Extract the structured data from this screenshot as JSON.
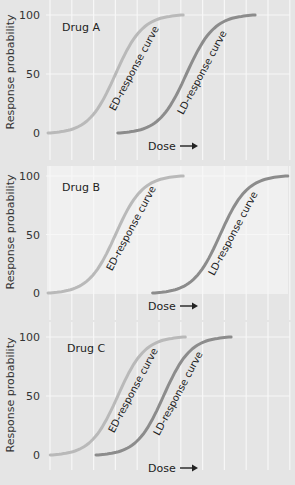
{
  "colors": {
    "background": "#e5e5e5",
    "panel_b_plot_bg": "#f0f0f0",
    "grid": "#f7f7f7",
    "ed_curve": "#b9b9b9",
    "ld_curve": "#8c8c8c",
    "text": "#2a2a2a"
  },
  "chart_data": [
    {
      "type": "line",
      "title": "Drug A",
      "xlabel": "Dose",
      "ylabel": "Response probability",
      "yticks": [
        0,
        50,
        100
      ],
      "ylim": [
        0,
        100
      ],
      "x_units": "relative dose (gridline index, 0-11)",
      "grid": true,
      "series": [
        {
          "name": "ED-response curve",
          "label": "ED-response curve",
          "x_start": 0.0,
          "x_end": 6.2,
          "ed50_x": 3.1,
          "y": [
            0,
            50,
            100
          ]
        },
        {
          "name": "LD-response curve",
          "label": "LD-response curve",
          "x_start": 3.2,
          "x_end": 9.5,
          "ld50_x": 6.35,
          "y": [
            0,
            50,
            100
          ]
        }
      ]
    },
    {
      "type": "line",
      "title": "Drug B",
      "xlabel": "Dose",
      "ylabel": "Response probability",
      "yticks": [
        0,
        50,
        100
      ],
      "ylim": [
        0,
        100
      ],
      "x_units": "relative dose (gridline index, 0-11)",
      "grid": true,
      "series": [
        {
          "name": "ED-response curve",
          "label": "ED-response curve",
          "x_start": 0.0,
          "x_end": 6.2,
          "ed50_x": 3.1,
          "y": [
            0,
            50,
            100
          ]
        },
        {
          "name": "LD-response curve",
          "label": "LD-response curve",
          "x_start": 4.8,
          "x_end": 11.0,
          "ld50_x": 7.9,
          "y": [
            0,
            50,
            100
          ]
        }
      ]
    },
    {
      "type": "line",
      "title": "Drug C",
      "xlabel": "Dose",
      "ylabel": "Response probability",
      "yticks": [
        0,
        50,
        100
      ],
      "ylim": [
        0,
        100
      ],
      "x_units": "relative dose (gridline index, 0-11)",
      "grid": true,
      "series": [
        {
          "name": "ED-response curve",
          "label": "ED-response curve",
          "x_start": 0.1,
          "x_end": 6.3,
          "ed50_x": 3.2,
          "y": [
            0,
            50,
            100
          ]
        },
        {
          "name": "LD-response curve",
          "label": "LD-response curve",
          "x_start": 2.2,
          "x_end": 8.4,
          "ld50_x": 5.3,
          "y": [
            0,
            50,
            100
          ]
        }
      ]
    }
  ],
  "layout": {
    "panels": [
      {
        "id": "panel-a",
        "y100": 15,
        "y0": 133,
        "plot_top": 0,
        "plot_bottom": 134,
        "grid_top": 0,
        "grid_bottom": 160,
        "shaded": false,
        "title_x": 62,
        "title_y": 31,
        "xlabel_y": 150,
        "ylabel_cx": 14,
        "ylabel_cy": 72,
        "ed_label": {
          "x": 137,
          "y": 70,
          "rot": -62
        },
        "ld_label": {
          "x": 205,
          "y": 74,
          "rot": -62
        }
      },
      {
        "id": "panel-b",
        "y100": 176,
        "y0": 293,
        "plot_top": 166,
        "plot_bottom": 294,
        "grid_top": 166,
        "grid_bottom": 320,
        "shaded": true,
        "title_x": 62,
        "title_y": 191,
        "xlabel_y": 310,
        "ylabel_cx": 14,
        "ylabel_cy": 232,
        "ed_label": {
          "x": 134,
          "y": 230,
          "rot": -62
        },
        "ld_label": {
          "x": 236,
          "y": 235,
          "rot": -62
        }
      },
      {
        "id": "panel-c",
        "y100": 337,
        "y0": 455,
        "plot_top": 322,
        "plot_bottom": 456,
        "grid_top": 322,
        "grid_bottom": 470,
        "shaded": false,
        "title_x": 67,
        "title_y": 352,
        "xlabel_y": 472,
        "ylabel_cx": 14,
        "ylabel_cy": 395,
        "ed_label": {
          "x": 136,
          "y": 392,
          "rot": -62
        },
        "ld_label": {
          "x": 181,
          "y": 395,
          "rot": -62
        }
      }
    ],
    "x0": 48,
    "x_spacing": 21.8,
    "grid_count": 12,
    "tick_x": 40,
    "dose_arrow_x": 148
  },
  "text": {
    "ylabel": "Response probability",
    "xlabel": "Dose",
    "arrow": "⟶",
    "ticks": [
      "0",
      "50",
      "100"
    ]
  }
}
